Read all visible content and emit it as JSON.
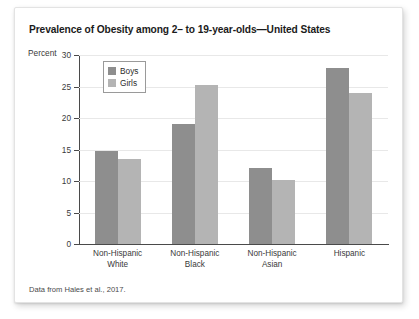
{
  "figure": {
    "title": "Prevalence of Obesity among 2– to 19-year-olds—United States",
    "y_axis_label": "Percent",
    "source_note": "Data from Hales et al., 2017.",
    "colors": {
      "boys": "#8e8e8e",
      "girls": "#b4b4b4",
      "gridline": "#e8e8e8",
      "axis": "#4a4a4a",
      "card_background": "#ffffff"
    }
  },
  "legend": {
    "position": "top-left-inside-plot",
    "entries": [
      {
        "label": "Boys",
        "color": "#8e8e8e"
      },
      {
        "label": "Girls",
        "color": "#b4b4b4"
      }
    ]
  },
  "chart_data": {
    "type": "bar",
    "title": "Prevalence of Obesity among 2– to 19-year-olds—United States",
    "xlabel": "",
    "ylabel": "Percent",
    "ylim": [
      0,
      30
    ],
    "yticks": [
      0,
      5,
      10,
      15,
      20,
      25,
      30
    ],
    "ytick_labels": [
      "0",
      "5",
      "10",
      "15",
      "20",
      "25",
      "30"
    ],
    "grid": true,
    "legend_position": "upper left",
    "categories": [
      "Non-Hispanic White",
      "Non-Hispanic Black",
      "Non-Hispanic Asian",
      "Hispanic"
    ],
    "category_lines": [
      [
        "Non-Hispanic",
        "White"
      ],
      [
        "Non-Hispanic",
        "Black"
      ],
      [
        "Non-Hispanic",
        "Asian"
      ],
      [
        "Hispanic",
        ""
      ]
    ],
    "series": [
      {
        "name": "Boys",
        "color": "#8e8e8e",
        "values": [
          14.8,
          19.0,
          12.0,
          28.0
        ]
      },
      {
        "name": "Girls",
        "color": "#b4b4b4",
        "values": [
          13.5,
          25.2,
          10.2,
          24.0
        ]
      }
    ],
    "annotation": "Data from Hales et al., 2017."
  }
}
